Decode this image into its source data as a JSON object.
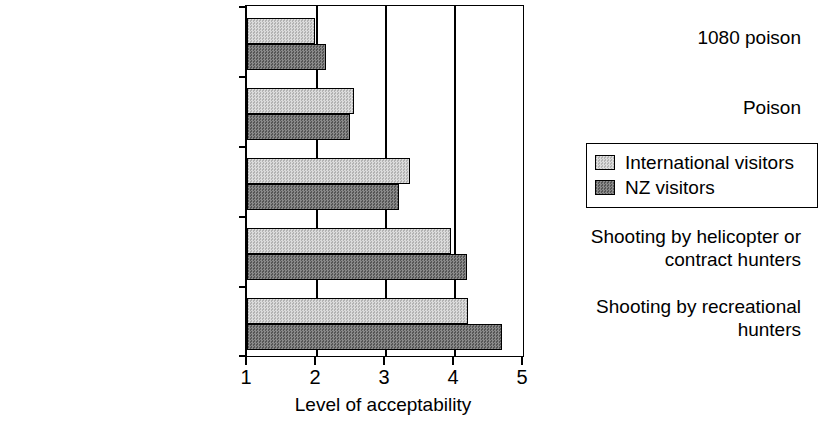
{
  "chart_data": {
    "type": "bar",
    "orientation": "horizontal",
    "title": "",
    "xlabel": "Level of acceptability",
    "ylabel": "",
    "xlim": [
      1,
      5
    ],
    "ylim": null,
    "xticks": [
      "1",
      "2",
      "3",
      "4",
      "5"
    ],
    "grid": "vertical",
    "legend_position": "right",
    "categories": [
      "1080 poison",
      "Poison",
      "Biological control",
      "Shooting by helicopter or contract hunters",
      "Shooting by recreational hunters"
    ],
    "category_lines": [
      [
        "1080 poison"
      ],
      [
        "Poison"
      ],
      [
        "Biological control"
      ],
      [
        "Shooting by helicopter or",
        "contract hunters"
      ],
      [
        "Shooting by recreational",
        "hunters"
      ]
    ],
    "series": [
      {
        "name": "International visitors",
        "color": "#c9c9c9",
        "values": [
          1.98,
          2.55,
          3.36,
          3.95,
          4.2
        ]
      },
      {
        "name": "NZ visitors",
        "color": "#6f6f6f",
        "values": [
          2.14,
          2.49,
          3.21,
          4.19,
          4.69
        ]
      }
    ]
  },
  "axis": {
    "x_title": "Level of acceptability",
    "tick_labels": [
      "1",
      "2",
      "3",
      "4",
      "5"
    ]
  },
  "legend": {
    "entries": [
      {
        "label": "International visitors",
        "swatch": "light-gray-hatch-swatch"
      },
      {
        "label": "NZ visitors",
        "swatch": "dark-gray-hatch-swatch"
      }
    ]
  },
  "categories": [
    {
      "line1": "1080 poison",
      "line2": ""
    },
    {
      "line1": "Poison",
      "line2": ""
    },
    {
      "line1": "Biological control",
      "line2": ""
    },
    {
      "line1": "Shooting by helicopter or",
      "line2": "contract hunters"
    },
    {
      "line1": "Shooting by recreational",
      "line2": "hunters"
    }
  ]
}
